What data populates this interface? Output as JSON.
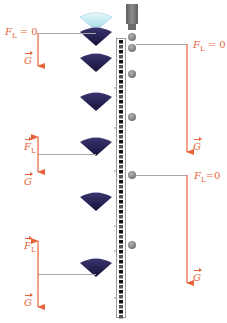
{
  "diagram": {
    "colors": {
      "force_arrow": "#e8633a",
      "leader_line": "#a0a0a0",
      "cone_dark": "#1e1b4a",
      "cone_light": "#bfe9f2",
      "ball": "#8a8a8a",
      "dropper": "#7a7a7a",
      "ruler_black": "#111111"
    },
    "left_series": {
      "description": "falling cone (paper filter) sequence",
      "labels": [
        {
          "force": "F",
          "sub": "L",
          "suffix": " = 0",
          "vector": false
        },
        {
          "force": "G",
          "vector": true
        },
        {
          "force": "F",
          "sub": "L",
          "vector": true
        },
        {
          "force": "G",
          "vector": true
        },
        {
          "force": "F",
          "sub": "L",
          "vector": true
        },
        {
          "force": "G",
          "vector": true
        }
      ]
    },
    "right_series": {
      "description": "falling ball sequence",
      "labels": [
        {
          "force": "F",
          "sub": "L",
          "suffix": " = 0",
          "vector": false
        },
        {
          "force": "G",
          "vector": true
        },
        {
          "force": "F",
          "sub": "L",
          "suffix": "=0",
          "vector": false
        },
        {
          "force": "G",
          "vector": true
        }
      ]
    }
  }
}
